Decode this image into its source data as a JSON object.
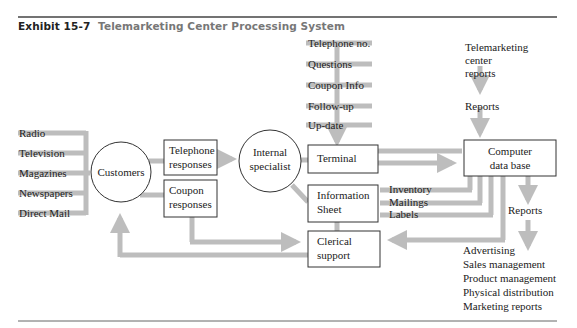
{
  "title": {
    "exhibit": "Exhibit 15-7",
    "name": "Telemarketing Center Processing System"
  },
  "media": [
    "Radio",
    "Television",
    "Magazines",
    "Newspapers",
    "Direct Mail"
  ],
  "nodes": {
    "customers": "Customers",
    "telephone_responses": [
      "Telephone",
      "responses"
    ],
    "coupon_responses": [
      "Coupon",
      "responses"
    ],
    "internal_specialist": [
      "Internal",
      "specialist"
    ],
    "terminal": "Terminal",
    "information_sheet": [
      "Information",
      "Sheet"
    ],
    "clerical_support": [
      "Clerical",
      "support"
    ],
    "computer_data_base": [
      "Computer",
      "data base"
    ]
  },
  "terminal_inputs": [
    "Telephone no.",
    "Questions",
    "Coupon Info",
    "Follow-up",
    "Up-date"
  ],
  "db_outputs_left": [
    "Inventory",
    "Mailings",
    "Labels"
  ],
  "telemarketing_reports": [
    "Telemarketing",
    "center",
    "reports"
  ],
  "reports_label_top": "Reports",
  "reports_label_bottom": "Reports",
  "report_recipients": [
    "Advertising",
    "Sales management",
    "Product management",
    "Physical distribution",
    "Marketing reports"
  ],
  "colors": {
    "line": "#bdbdbd",
    "rule": "#444444",
    "box": "#333333"
  }
}
